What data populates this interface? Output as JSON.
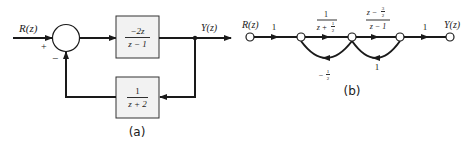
{
  "diagram_a": {
    "caption": "(a)",
    "input_label": "R(z)",
    "output_label": "Y(z)",
    "summing_junction": {
      "plus_sign": "+",
      "minus_sign": "−"
    },
    "forward_block": {
      "numerator": "−2z",
      "denominator": "z − 1"
    },
    "feedback_block": {
      "numerator": "1",
      "denominator": "z + 2"
    }
  },
  "diagram_b": {
    "caption": "(b)",
    "input_label": "R(z)",
    "output_label": "Y(z)",
    "branches": [
      {
        "from": "R(z)",
        "to": "n1",
        "gain": "1"
      },
      {
        "from": "n1",
        "to": "n2",
        "gain_numerator": "1",
        "gain_denominator_main": "z + ",
        "gain_denominator_frac_num": "1",
        "gain_denominator_frac_den": "2"
      },
      {
        "from": "n2",
        "to": "n3",
        "gain_numerator_main": "z − ",
        "gain_numerator_frac_num": "3",
        "gain_numerator_frac_den": "2",
        "gain_denominator": "z − 1"
      },
      {
        "from": "n3",
        "to": "Y(z)",
        "gain": "1"
      },
      {
        "from": "n2",
        "to": "n1",
        "gain_sign": "−",
        "gain_frac_num": "1",
        "gain_frac_den": "2",
        "type": "feedback"
      },
      {
        "from": "n3",
        "to": "n2",
        "gain": "1",
        "type": "feedback"
      }
    ]
  },
  "colors": {
    "ink": "#1a1a1a",
    "block_fill": "#f2f2f2",
    "background": "#ffffff"
  }
}
